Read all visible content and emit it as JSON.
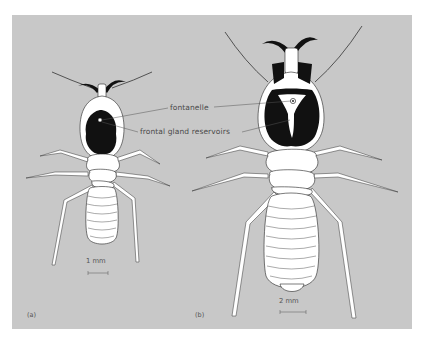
{
  "figure": {
    "background_color": "#c8c8c8",
    "ink_color": "#111111",
    "body_color": "#ffffff",
    "annotations": {
      "fontanelle": "fontanelle",
      "frontal_gland": "frontal gland reservoirs"
    },
    "panels": [
      {
        "id": "a",
        "label": "(a)",
        "scale_bar": "1 mm",
        "subject": "termite soldier, smaller species, dorsal view"
      },
      {
        "id": "b",
        "label": "(b)",
        "scale_bar": "2 mm",
        "subject": "termite soldier, larger species, dorsal view"
      }
    ]
  }
}
